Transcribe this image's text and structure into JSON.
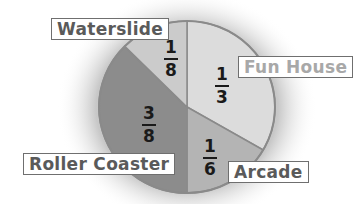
{
  "chart_data": {
    "type": "pie",
    "title": "",
    "categories": [
      "Fun House",
      "Arcade",
      "Roller Coaster",
      "Waterslide"
    ],
    "values": [
      0.3333,
      0.1667,
      0.375,
      0.125
    ],
    "fraction_labels": [
      "1/3",
      "1/6",
      "3/8",
      "1/8"
    ],
    "colors": [
      "#dcdcdc",
      "#b4b4b4",
      "#8c8c8c",
      "#cbcbcb"
    ],
    "legend": "none (callout labels)"
  },
  "slices": [
    {
      "label": "Fun House",
      "num": "1",
      "den": "3"
    },
    {
      "label": "Arcade",
      "num": "1",
      "den": "6"
    },
    {
      "label": "Roller Coaster",
      "num": "3",
      "den": "8"
    },
    {
      "label": "Waterslide",
      "num": "1",
      "den": "8"
    }
  ]
}
